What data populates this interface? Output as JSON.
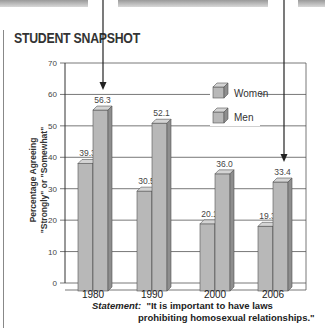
{
  "header": {
    "title": "STUDENT SNAPSHOT"
  },
  "statement": {
    "label": "Statement:",
    "line1": "\"It is important to have laws",
    "line2": "prohibiting homosexual relationships.\""
  },
  "colors": {
    "bar_front": "#b8b8b8",
    "bar_top": "#d4d4d4",
    "bar_side": "#8e8e8e",
    "grid": "#555555"
  },
  "chart_data": {
    "type": "bar",
    "title": "",
    "xlabel": "",
    "ylabel_line1": "Percentage Agreeing",
    "ylabel_line2": "\"Strongly\" or \"Somewhat\"",
    "categories": [
      "1980",
      "1990",
      "2000",
      "2006"
    ],
    "series": [
      {
        "name": "Women",
        "values": [
          39.3,
          30.5,
          20.1,
          19.3
        ],
        "labels": [
          "39.3",
          "30.5",
          "20.1",
          "19.3"
        ]
      },
      {
        "name": "Men",
        "values": [
          56.3,
          52.1,
          36.0,
          33.4
        ],
        "labels": [
          "56.3",
          "52.1",
          "36.0",
          "33.4"
        ]
      }
    ],
    "ylim": [
      0,
      70
    ],
    "yticks": [
      "0",
      "10",
      "20",
      "30",
      "40",
      "50",
      "60",
      "70"
    ],
    "grid": true,
    "legend": "top-right",
    "style": "3d-bar"
  }
}
